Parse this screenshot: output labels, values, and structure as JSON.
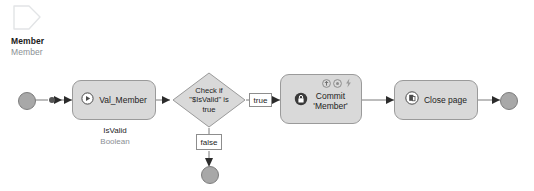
{
  "entity": {
    "icon": "page-shape-icon",
    "name": "Member",
    "type": "Member"
  },
  "flow": {
    "start_node": {
      "name": "start-event",
      "label": ""
    },
    "start_dot": {
      "name": "connector-dot"
    },
    "action": {
      "icon": "play-circle-icon",
      "label": "Val_Member",
      "caption_name": "IsValid",
      "caption_type": "Boolean"
    },
    "gateway": {
      "line1": "Check if",
      "line2": "\"$IsValid\" is",
      "line3": "true"
    },
    "edge_true": "true",
    "edge_false": "false",
    "commit": {
      "icon": "commit-lock-icon",
      "line1": "Commit",
      "line2": "'Member'",
      "badges": [
        "arrow-up-circle-icon",
        "refresh-circle-icon",
        "lightning-bolt-icon"
      ]
    },
    "close_page": {
      "icon": "close-page-icon",
      "label": "Close page"
    },
    "end_node_right": {
      "name": "end-event-right"
    },
    "end_node_false": {
      "name": "end-event-false"
    }
  },
  "colors": {
    "node_fill": "#d9d9d9",
    "node_stroke": "#9a9a9a",
    "terminal_fill": "#a8a8a8",
    "line": "#7a7a7a",
    "text": "#1d1d1d",
    "muted_text": "#8a8f94",
    "background": "#ffffff"
  }
}
